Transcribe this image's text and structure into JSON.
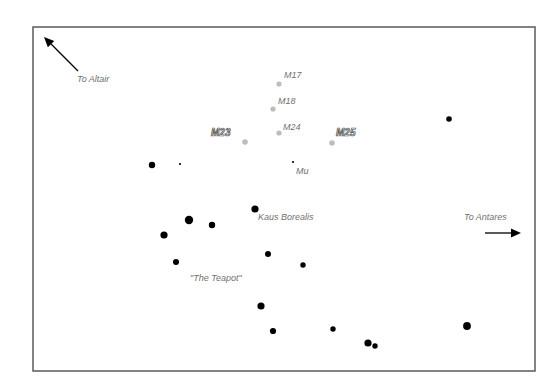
{
  "diagram": {
    "frame": {
      "x": 33,
      "y": 27,
      "width": 502,
      "height": 344,
      "stroke": "#5a5a5a"
    },
    "colors": {
      "star": "#000000",
      "cluster": "#bdbdbd",
      "label": "#707070",
      "outline_label_stroke": "#555555"
    },
    "directions": [
      {
        "id": "altair",
        "label": "To Altair",
        "label_x": 77,
        "label_y": 82,
        "arrow": {
          "x1": 78,
          "y1": 71,
          "x2": 44,
          "y2": 37
        }
      },
      {
        "id": "antares",
        "label": "To Antares",
        "label_x": 464,
        "label_y": 220,
        "arrow": {
          "x1": 485,
          "y1": 233,
          "x2": 521,
          "y2": 233
        }
      }
    ],
    "clusters": [
      {
        "name": "M17",
        "x": 279,
        "y": 84,
        "r": 2.6,
        "label_x": 284,
        "label_y": 78,
        "style": "plain"
      },
      {
        "name": "M18",
        "x": 273,
        "y": 109,
        "r": 2.6,
        "label_x": 278,
        "label_y": 104,
        "style": "plain"
      },
      {
        "name": "M24",
        "x": 279,
        "y": 133,
        "r": 2.6,
        "label_x": 283,
        "label_y": 130,
        "style": "plain"
      },
      {
        "name": "M23",
        "x": 245,
        "y": 142,
        "r": 2.8,
        "label_x": 211,
        "label_y": 136,
        "style": "outline"
      },
      {
        "name": "M25",
        "x": 332,
        "y": 143,
        "r": 2.8,
        "label_x": 336,
        "label_y": 136,
        "style": "outline"
      }
    ],
    "stars": [
      {
        "x": 152,
        "y": 165,
        "r": 3.2
      },
      {
        "x": 180,
        "y": 164,
        "r": 1.1
      },
      {
        "x": 293,
        "y": 162,
        "r": 1.1,
        "name": "Mu",
        "label_x": 296,
        "label_y": 174
      },
      {
        "x": 449,
        "y": 119,
        "r": 2.8
      },
      {
        "x": 255,
        "y": 209,
        "r": 3.6,
        "name": "Kaus Borealis",
        "label_x": 258,
        "label_y": 220
      },
      {
        "x": 189,
        "y": 220,
        "r": 4.2
      },
      {
        "x": 212,
        "y": 225,
        "r": 3.2
      },
      {
        "x": 164,
        "y": 235,
        "r": 3.6
      },
      {
        "x": 268,
        "y": 254,
        "r": 3.0
      },
      {
        "x": 176,
        "y": 262,
        "r": 3.0
      },
      {
        "x": 303,
        "y": 265,
        "r": 2.7
      },
      {
        "x": 261,
        "y": 306,
        "r": 3.6
      },
      {
        "x": 273,
        "y": 331,
        "r": 3.1
      },
      {
        "x": 333,
        "y": 329,
        "r": 2.7
      },
      {
        "x": 368,
        "y": 343,
        "r": 3.6
      },
      {
        "x": 375,
        "y": 346,
        "r": 2.7
      },
      {
        "x": 467,
        "y": 326,
        "r": 3.9
      }
    ],
    "annotations": [
      {
        "text": "\"The Teapot\"",
        "x": 190,
        "y": 281
      }
    ]
  }
}
